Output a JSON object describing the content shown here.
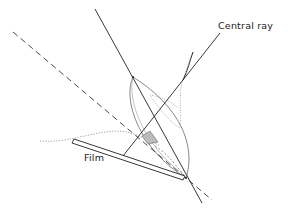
{
  "diagram": {
    "labels": {
      "central_ray": "Central ray",
      "film": "Film"
    },
    "colors": {
      "line": "#222222",
      "background": "#ffffff",
      "stipple": "#9a9a9a"
    }
  }
}
